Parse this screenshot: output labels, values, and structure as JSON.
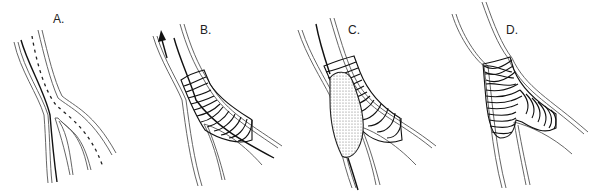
{
  "figure": {
    "panels": [
      {
        "id": "A",
        "label": "A.",
        "description": "Bifurcation with main-branch guidewire (solid) and side-branch guidewire (dashed)"
      },
      {
        "id": "B",
        "label": "B.",
        "description": "Stent deployed in main vessel across side branch, with arrow indicating wire withdrawal"
      },
      {
        "id": "C",
        "label": "C.",
        "description": "Balloon (stippled) inflated through stent struts into side branch"
      },
      {
        "id": "D",
        "label": "D.",
        "description": "Final result with stent struts opened toward side branch"
      }
    ],
    "colors": {
      "line": "#222222",
      "wall": "#555555",
      "balloon_fill": "#d8d8d8",
      "background": "#ffffff"
    }
  }
}
